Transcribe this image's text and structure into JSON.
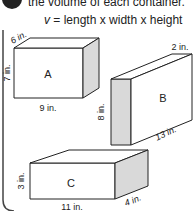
{
  "instruction": "the volume of each container.",
  "formula": {
    "variable": "v",
    "expression": "= length x width x height"
  },
  "boxes": [
    {
      "label": "A",
      "length": "9 in.",
      "width": "6 in.",
      "height": "7 in."
    },
    {
      "label": "B",
      "length": "13 in.",
      "width": "2 in.",
      "height": "8 in."
    },
    {
      "label": "C",
      "length": "11 in.",
      "width": "4 in.",
      "height": "3 in."
    }
  ],
  "colors": {
    "stroke": "#222222",
    "shaded_face": "#d9d9d9",
    "background": "#ffffff"
  }
}
